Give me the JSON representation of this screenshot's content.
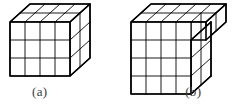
{
  "figure": {
    "background_color": "#ffffff",
    "line_color": "#000000",
    "face_color": "#ffffff",
    "shading_color": "#2b2b2b",
    "projection": "oblique",
    "captions": [
      {
        "id": "a",
        "label": "(a)"
      },
      {
        "id": "b",
        "label": "(b)"
      }
    ],
    "solids": [
      {
        "id": "a",
        "name": "rectangular-box",
        "caption": "(a)",
        "front_face_columns": 4,
        "front_face_rows": 3,
        "depth_cubes": 2,
        "top_face_columns": 4,
        "top_face_rows": 2,
        "side_face_columns": 2,
        "side_face_rows": 3,
        "total_cubes": 24,
        "has_overhang": "no"
      },
      {
        "id": "b",
        "name": "box-with-top-overhang",
        "caption": "(b)",
        "front_face_columns": 4,
        "front_face_rows": 4,
        "depth_cubes": 2,
        "top_face_columns": 5,
        "top_face_rows": 2,
        "side_face_columns": 2,
        "side_face_rows": 4,
        "overhang_columns": 1,
        "overhang_rows": 1,
        "total_cubes": 42,
        "has_overhang": "yes"
      }
    ]
  }
}
